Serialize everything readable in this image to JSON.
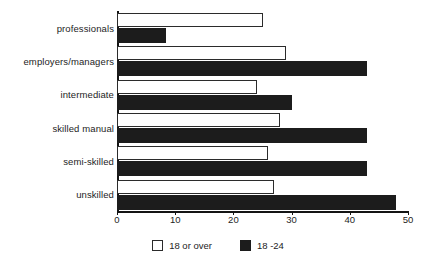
{
  "chart_data": {
    "type": "bar",
    "orientation": "horizontal",
    "title": "",
    "subtitle": "",
    "xlabel": "",
    "ylabel": "",
    "xlim": [
      0,
      50
    ],
    "xticks": [
      0,
      10,
      20,
      30,
      40,
      50
    ],
    "xtick_labels": [
      "0",
      "10",
      "20",
      "30",
      "40",
      "50"
    ],
    "grid": false,
    "legend_position": "bottom",
    "categories": [
      "professionals",
      "employers/managers",
      "intermediate",
      "skilled manual",
      "semi-skilled",
      "unskilled"
    ],
    "series": [
      {
        "name": "18 or over",
        "color": "#ffffff",
        "edge_color": "#2b2b2b",
        "values": [
          25,
          29,
          24,
          28,
          26,
          27
        ]
      },
      {
        "name": "18 -24",
        "color": "#1c1c1c",
        "edge_color": "#1c1c1c",
        "values": [
          8.5,
          43,
          30,
          43,
          43,
          48
        ]
      }
    ]
  },
  "legend": {
    "items": [
      {
        "label": "18 or over",
        "swatch": "light"
      },
      {
        "label": "18 -24",
        "swatch": "dark"
      }
    ]
  },
  "colors": {
    "axis": "#141414",
    "text": "#1d1d1d",
    "background": "#ffffff",
    "series_light": "#ffffff",
    "series_dark": "#1c1c1c"
  }
}
